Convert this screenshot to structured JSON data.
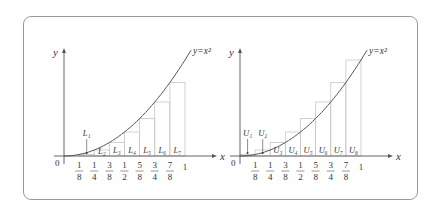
{
  "figure": {
    "panels": [
      {
        "id": "left",
        "curve_label": "y=x²",
        "axis_labels": {
          "x": "x",
          "y": "y",
          "origin": "0"
        },
        "ticks": [
          {
            "num": "1",
            "den": "8"
          },
          {
            "num": "1",
            "den": "4"
          },
          {
            "num": "3",
            "den": "8"
          },
          {
            "num": "1",
            "den": "2"
          },
          {
            "num": "5",
            "den": "8"
          },
          {
            "num": "3",
            "den": "4"
          },
          {
            "num": "7",
            "den": "8"
          },
          {
            "num": "1",
            "den": ""
          }
        ],
        "rect_type": "left endpoint (lower sum)",
        "rect_labels": [
          "L₁",
          "L₂",
          "L₃",
          "L₄",
          "L₅",
          "L₆",
          "L₇"
        ]
      },
      {
        "id": "right",
        "curve_label": "y=x²",
        "axis_labels": {
          "x": "x",
          "y": "y",
          "origin": "0"
        },
        "ticks": [
          {
            "num": "1",
            "den": "8"
          },
          {
            "num": "1",
            "den": "4"
          },
          {
            "num": "3",
            "den": "8"
          },
          {
            "num": "1",
            "den": "2"
          },
          {
            "num": "5",
            "den": "8"
          },
          {
            "num": "3",
            "den": "4"
          },
          {
            "num": "7",
            "den": "8"
          },
          {
            "num": "1",
            "den": ""
          }
        ],
        "rect_type": "right endpoint (upper sum)",
        "rect_labels": [
          "U₁",
          "U₂",
          "U₃",
          "U₄",
          "U₅",
          "U₆",
          "U₇",
          "U₈"
        ]
      }
    ],
    "colors": {
      "frame": "#9a9a9a",
      "axis": "#555555",
      "curve": "#555555",
      "rect": "#c8c8c8"
    }
  }
}
